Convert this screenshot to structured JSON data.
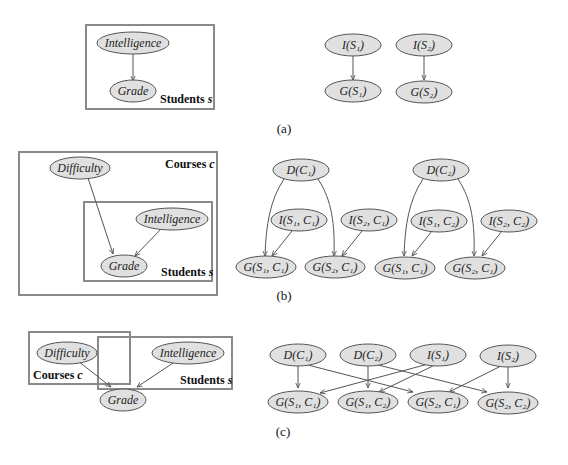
{
  "panels": [
    {
      "id": "a",
      "caption": "(a)",
      "template": {
        "nodes": [
          {
            "id": "I",
            "label": "Intelligence"
          },
          {
            "id": "G",
            "label": "Grade"
          }
        ],
        "plates": [
          {
            "label_main": "Students",
            "label_var": "s"
          }
        ],
        "edges": [
          [
            "I",
            "G"
          ]
        ]
      },
      "ground": {
        "nodes": [
          {
            "id": "I1",
            "label": "I(S₁)"
          },
          {
            "id": "I2",
            "label": "I(S₂)"
          },
          {
            "id": "G1",
            "label": "G(S₁)"
          },
          {
            "id": "G2",
            "label": "G(S₂)"
          }
        ],
        "edges": [
          [
            "I1",
            "G1"
          ],
          [
            "I2",
            "G2"
          ]
        ]
      }
    },
    {
      "id": "b",
      "caption": "(b)",
      "template": {
        "nodes": [
          {
            "id": "D",
            "label": "Difficulty"
          },
          {
            "id": "I",
            "label": "Intelligence"
          },
          {
            "id": "G",
            "label": "Grade"
          }
        ],
        "plates": [
          {
            "label_main": "Courses",
            "label_var": "c"
          },
          {
            "label_main": "Students",
            "label_var": "s"
          }
        ],
        "edges": [
          [
            "D",
            "G"
          ],
          [
            "I",
            "G"
          ]
        ]
      },
      "ground": {
        "nodes": [
          {
            "id": "D1",
            "label": "D(C₁)"
          },
          {
            "id": "D2",
            "label": "D(C₂)"
          },
          {
            "id": "I11",
            "label": "I(S₁, C₁)"
          },
          {
            "id": "I21",
            "label": "I(S₂, C₁)"
          },
          {
            "id": "I12",
            "label": "I(S₁, C₂)"
          },
          {
            "id": "I22",
            "label": "I(S₂, C₂)"
          },
          {
            "id": "G11",
            "label": "G(S₁, C₁)"
          },
          {
            "id": "G21",
            "label": "G(S₂, C₁)"
          },
          {
            "id": "G12",
            "label": "G(S₁, C₁)"
          },
          {
            "id": "G22",
            "label": "G(S₂, C₁)"
          }
        ],
        "edges": [
          [
            "D1",
            "G11"
          ],
          [
            "D1",
            "G21"
          ],
          [
            "I11",
            "G11"
          ],
          [
            "I21",
            "G21"
          ],
          [
            "D2",
            "G12"
          ],
          [
            "D2",
            "G22"
          ],
          [
            "I12",
            "G12"
          ],
          [
            "I22",
            "G22"
          ]
        ]
      }
    },
    {
      "id": "c",
      "caption": "(c)",
      "template": {
        "nodes": [
          {
            "id": "D",
            "label": "Difficulty"
          },
          {
            "id": "I",
            "label": "Intelligence"
          },
          {
            "id": "G",
            "label": "Grade"
          }
        ],
        "plates": [
          {
            "label_main": "Courses",
            "label_var": "c"
          },
          {
            "label_main": "Students",
            "label_var": "s"
          }
        ],
        "edges": [
          [
            "D",
            "G"
          ],
          [
            "I",
            "G"
          ]
        ]
      },
      "ground": {
        "nodes": [
          {
            "id": "D1",
            "label": "D(C₁)"
          },
          {
            "id": "D2",
            "label": "D(C₂)"
          },
          {
            "id": "I1",
            "label": "I(S₁)"
          },
          {
            "id": "I2",
            "label": "I(S₂)"
          },
          {
            "id": "G11",
            "label": "G(S₁, C₁)"
          },
          {
            "id": "G12",
            "label": "G(S₁, C₂)"
          },
          {
            "id": "G21",
            "label": "G(S₂, C₁)"
          },
          {
            "id": "G22",
            "label": "G(S₂, C₂)"
          }
        ],
        "edges": [
          [
            "D1",
            "G11"
          ],
          [
            "D1",
            "G21"
          ],
          [
            "D2",
            "G12"
          ],
          [
            "D2",
            "G22"
          ],
          [
            "I1",
            "G11"
          ],
          [
            "I1",
            "G12"
          ],
          [
            "I2",
            "G21"
          ],
          [
            "I2",
            "G22"
          ]
        ]
      }
    }
  ]
}
